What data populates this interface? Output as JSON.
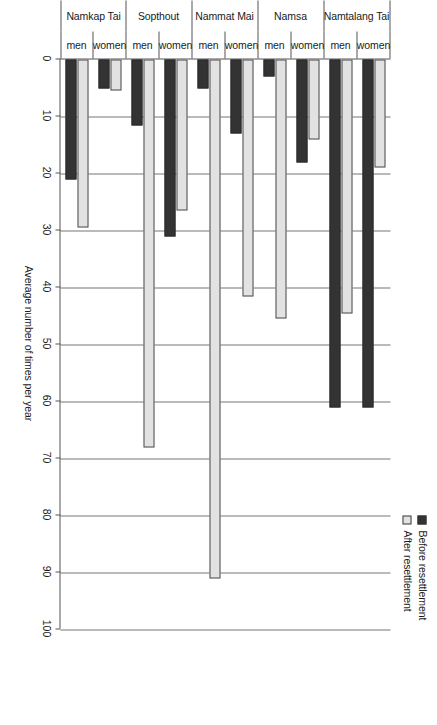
{
  "chart_data": {
    "type": "bar",
    "orientation": "horizontal",
    "title": "",
    "xlabel": "Average number of times per year",
    "ylabel": "",
    "xlim": [
      0,
      100
    ],
    "xticks": [
      0,
      10,
      20,
      30,
      40,
      50,
      60,
      70,
      80,
      90,
      100
    ],
    "grid": true,
    "legend_position": "top",
    "group_label_tiers": [
      "sex",
      "village"
    ],
    "villages": [
      "Namkap Tai",
      "Sopthout",
      "Nammat Mai",
      "Namsa",
      "Namtalang Tai"
    ],
    "sexes": [
      "men",
      "women"
    ],
    "categories": [
      "Namkap Tai men",
      "Namkap Tai women",
      "Sopthout men",
      "Sopthout women",
      "Nammat Mai men",
      "Nammat Mai women",
      "Namsa men",
      "Namsa women",
      "Namtalang Tai men",
      "Namtalang Tai women"
    ],
    "series": [
      {
        "name": "Before resettlement",
        "color": "#333333",
        "values": [
          21,
          5,
          11.5,
          31,
          5,
          13,
          3,
          18,
          61,
          61
        ]
      },
      {
        "name": "After resettlement",
        "color": "#e2e2e2",
        "values": [
          29.5,
          5.5,
          68,
          26.5,
          91,
          41.5,
          45.5,
          14,
          44.5,
          19
        ]
      }
    ]
  },
  "legend": {
    "items": [
      {
        "label": "Before resettlement",
        "swatch": "before"
      },
      {
        "label": "After resettlement",
        "swatch": "after"
      }
    ]
  },
  "axis": {
    "value_title": "Average number of times per year",
    "tick_labels": [
      "0",
      "10",
      "20",
      "30",
      "40",
      "50",
      "60",
      "70",
      "80",
      "90",
      "100"
    ]
  },
  "categories_tier1": [
    "men",
    "women",
    "men",
    "women",
    "men",
    "women",
    "men",
    "women",
    "men",
    "women"
  ],
  "categories_tier2": [
    "Namkap Tai",
    "Sopthout",
    "Nammat Mai",
    "Namsa",
    "Namtalang Tai"
  ]
}
